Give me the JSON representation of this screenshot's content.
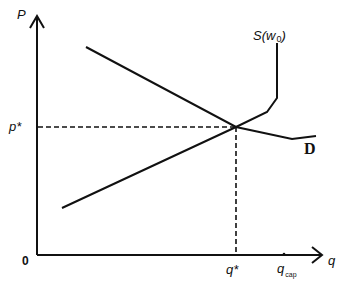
{
  "diagram": {
    "type": "supply-demand",
    "axes": {
      "y_label": "P",
      "x_label": "q",
      "origin_label": "0"
    },
    "curves": {
      "supply": {
        "label_main": "S(w",
        "label_sub": "0",
        "label_close": ")"
      },
      "demand": {
        "label": "D"
      }
    },
    "equilibrium": {
      "price_label": "p*",
      "quantity_label": "q*"
    },
    "capacity": {
      "label_main": "q",
      "label_sub": "cap"
    },
    "colors": {
      "line": "#111111",
      "background": "#ffffff"
    }
  }
}
